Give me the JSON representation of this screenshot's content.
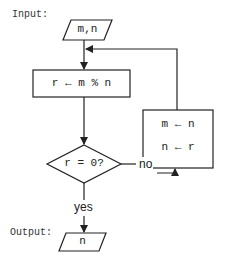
{
  "diagram": {
    "type": "flowchart",
    "labels": {
      "input": "Input:",
      "output": "Output:"
    },
    "nodes": {
      "input": {
        "shape": "parallelogram",
        "text": "m,n"
      },
      "remainder": {
        "shape": "rectangle",
        "text": "r ← m % n"
      },
      "decision": {
        "shape": "diamond",
        "text": "r = 0?"
      },
      "swap": {
        "shape": "rectangle",
        "line1": "m ← n",
        "line2": "n ← r"
      },
      "output": {
        "shape": "parallelogram",
        "text": "n"
      }
    },
    "edges": [
      {
        "from": "input",
        "to": "remainder",
        "label": ""
      },
      {
        "from": "remainder",
        "to": "decision",
        "label": ""
      },
      {
        "from": "decision",
        "to": "swap",
        "label": "no"
      },
      {
        "from": "swap",
        "to": "remainder",
        "label": ""
      },
      {
        "from": "decision",
        "to": "output",
        "label": "yes"
      }
    ],
    "edge_labels": {
      "no": "no",
      "yes": "yes"
    },
    "colors": {
      "stroke": "#222222",
      "background": "#ffffff"
    }
  }
}
